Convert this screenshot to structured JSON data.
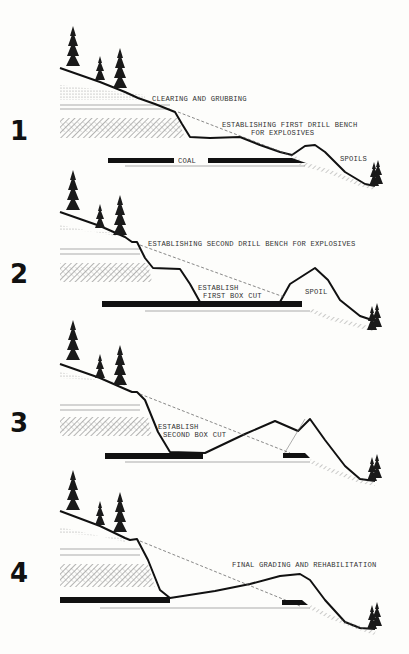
{
  "figure": {
    "panels": [
      {
        "number": "1",
        "labels": {
          "a": "CLEARING AND GRUBBING",
          "b1": "ESTABLISHING FIRST DRILL BENCH",
          "b2": "FOR EXPLOSIVES",
          "coal": "COAL",
          "spoil": "SPOILS"
        }
      },
      {
        "number": "2",
        "labels": {
          "a": "ESTABLISHING SECOND DRILL BENCH FOR EXPLOSIVES",
          "b1": "ESTABLISH",
          "b2": "FIRST BOX CUT",
          "spoil": "SPOIL"
        }
      },
      {
        "number": "3",
        "labels": {
          "b1": "ESTABLISH",
          "b2": "SECOND BOX CUT"
        }
      },
      {
        "number": "4",
        "labels": {
          "a": "FINAL GRADING AND REHABILITATION"
        }
      }
    ]
  },
  "colors": {
    "ink": "#111111",
    "paper": "#fdfdfb",
    "hatch": "#888888"
  }
}
